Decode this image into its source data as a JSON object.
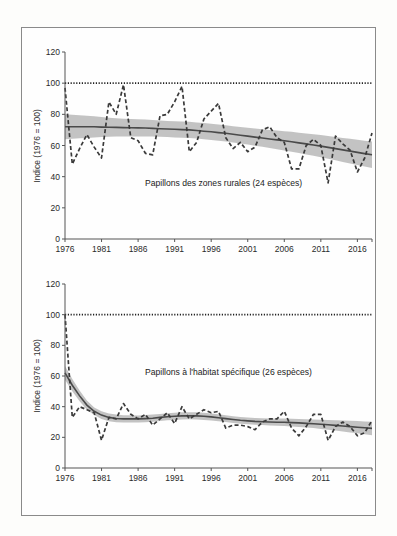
{
  "chart_data": [
    {
      "type": "line",
      "title": "Papillons des zones rurales (24 espèces)",
      "xlabel": "",
      "ylabel": "Indice (1976 = 100)",
      "ylim": [
        0,
        120
      ],
      "yticks": [
        0,
        20,
        40,
        60,
        80,
        100,
        120
      ],
      "xticks": [
        1976,
        1981,
        1986,
        1991,
        1996,
        2001,
        2006,
        2011,
        2016
      ],
      "xlim": [
        1976,
        2018
      ],
      "reference_line": {
        "value": 100,
        "style": "dotted"
      },
      "grid": false,
      "x": [
        1976,
        1977,
        1978,
        1979,
        1980,
        1981,
        1982,
        1983,
        1984,
        1985,
        1986,
        1987,
        1988,
        1989,
        1990,
        1991,
        1992,
        1993,
        1994,
        1995,
        1996,
        1997,
        1998,
        1999,
        2000,
        2001,
        2002,
        2003,
        2004,
        2005,
        2006,
        2007,
        2008,
        2009,
        2010,
        2011,
        2012,
        2013,
        2014,
        2015,
        2016,
        2017,
        2018
      ],
      "series": [
        {
          "name": "Indice annuel",
          "style": "dashed",
          "values": [
            97,
            48,
            58,
            67,
            59,
            52,
            88,
            80,
            99,
            65,
            63,
            55,
            54,
            79,
            80,
            88,
            98,
            56,
            62,
            77,
            82,
            87,
            65,
            58,
            62,
            56,
            59,
            70,
            72,
            65,
            62,
            45,
            45,
            60,
            64,
            60,
            36,
            66,
            61,
            57,
            43,
            52,
            68
          ]
        },
        {
          "name": "Tendance lissée",
          "style": "solid",
          "values": [
            72,
            72,
            72,
            72,
            72,
            71.8,
            71.7,
            71.6,
            71.5,
            71.4,
            71.3,
            71.2,
            71,
            70.8,
            70.6,
            70.4,
            70.2,
            70,
            69.6,
            69.2,
            68.8,
            68.3,
            67.8,
            67.2,
            66.6,
            66,
            65.4,
            64.8,
            64.2,
            63.6,
            63,
            62.4,
            61.7,
            61,
            60.3,
            59.6,
            58.8,
            58,
            57.2,
            56.4,
            55.6,
            54.8,
            54
          ]
        },
        {
          "name": "Intervalle de confiance (bas)",
          "style": "band",
          "values": [
            64,
            64.3,
            64.6,
            64.9,
            65.2,
            65.4,
            65.6,
            65.7,
            65.8,
            65.8,
            65.8,
            65.8,
            65.7,
            65.6,
            65.4,
            65.2,
            65,
            64.8,
            64.4,
            64,
            63.6,
            63.1,
            62.6,
            62,
            61.3,
            60.6,
            59.9,
            59.2,
            58.4,
            57.6,
            56.8,
            56,
            55.2,
            54.3,
            53.4,
            52.5,
            51.5,
            50.5,
            49.5,
            48.5,
            47.5,
            46.5,
            45.5
          ]
        },
        {
          "name": "Intervalle de confiance (haut)",
          "style": "band",
          "values": [
            80,
            79.7,
            79.4,
            79.1,
            78.8,
            78.2,
            77.8,
            77.5,
            77.2,
            77,
            76.8,
            76.6,
            76.3,
            76,
            75.8,
            75.6,
            75.4,
            75.2,
            74.8,
            74.4,
            74,
            73.5,
            73,
            72.4,
            71.9,
            71.4,
            70.9,
            70.4,
            70,
            69.6,
            69.2,
            68.8,
            68.2,
            67.7,
            67.2,
            66.7,
            66.1,
            65.5,
            64.9,
            64.3,
            63.7,
            63.1,
            62.5
          ]
        }
      ]
    },
    {
      "type": "line",
      "title": "Papillons à l'habitat spécifique (26 espèces)",
      "xlabel": "",
      "ylabel": "Indice (1976 = 100)",
      "ylim": [
        0,
        120
      ],
      "yticks": [
        0,
        20,
        40,
        60,
        80,
        100,
        120
      ],
      "xticks": [
        1976,
        1981,
        1986,
        1991,
        1996,
        2001,
        2006,
        2011,
        2016
      ],
      "xlim": [
        1976,
        2018
      ],
      "reference_line": {
        "value": 100,
        "style": "dotted"
      },
      "grid": false,
      "x": [
        1976,
        1977,
        1978,
        1979,
        1980,
        1981,
        1982,
        1983,
        1984,
        1985,
        1986,
        1987,
        1988,
        1989,
        1990,
        1991,
        1992,
        1993,
        1994,
        1995,
        1996,
        1997,
        1998,
        1999,
        2000,
        2001,
        2002,
        2003,
        2004,
        2005,
        2006,
        2007,
        2008,
        2009,
        2010,
        2011,
        2012,
        2013,
        2014,
        2015,
        2016,
        2017,
        2018
      ],
      "series": [
        {
          "name": "Indice annuel",
          "style": "dashed",
          "values": [
            100,
            33,
            40,
            38,
            36,
            18,
            33,
            32,
            42,
            35,
            32,
            35,
            28,
            32,
            36,
            29,
            40,
            32,
            35,
            38,
            36,
            37,
            26,
            28,
            28,
            27,
            25,
            30,
            32,
            32,
            37,
            26,
            21,
            27,
            35,
            35,
            18,
            27,
            30,
            27,
            21,
            23,
            31
          ]
        },
        {
          "name": "Tendance lissée",
          "style": "solid",
          "values": [
            62,
            54,
            47,
            41,
            37,
            34.5,
            33,
            32.3,
            32,
            32,
            32,
            32.2,
            32.5,
            33,
            33.4,
            33.7,
            34,
            34.1,
            34,
            33.7,
            33.3,
            32.8,
            32.2,
            31.6,
            31.1,
            30.7,
            30.4,
            30.2,
            30,
            29.9,
            29.8,
            29.6,
            29.4,
            29.1,
            28.8,
            28.5,
            28.2,
            27.8,
            27.4,
            27,
            26.6,
            26.2,
            25.8
          ]
        },
        {
          "name": "Intervalle de confiance (bas)",
          "style": "band",
          "values": [
            57.5,
            50,
            43.5,
            38,
            34.5,
            32,
            30.5,
            29.8,
            29.6,
            29.6,
            29.7,
            29.9,
            30.2,
            30.7,
            31.1,
            31.4,
            31.7,
            31.8,
            31.7,
            31.4,
            31,
            30.5,
            30,
            29.4,
            28.9,
            28.5,
            28.2,
            28,
            27.8,
            27.6,
            27.4,
            27.1,
            26.8,
            26.4,
            26,
            25.5,
            25,
            24.4,
            23.8,
            23.2,
            22.6,
            22,
            21.4
          ]
        },
        {
          "name": "Intervalle de confiance (haut)",
          "style": "band",
          "values": [
            66.5,
            58,
            50.5,
            44,
            39.5,
            37,
            35.5,
            34.8,
            34.4,
            34.4,
            34.3,
            34.5,
            34.8,
            35.3,
            35.7,
            36,
            36.3,
            36.4,
            36.3,
            36,
            35.6,
            35.1,
            34.4,
            33.8,
            33.3,
            32.9,
            32.6,
            32.4,
            32.2,
            32.2,
            32.2,
            32.1,
            32,
            31.8,
            31.6,
            31.5,
            31.4,
            31.2,
            31,
            30.8,
            30.6,
            30.4,
            30.2
          ]
        }
      ]
    }
  ],
  "panels": [
    {
      "ylabel": "Indice (1976 = 100)",
      "series_label": "Papillons des zones rurales (24 espèces)"
    },
    {
      "ylabel": "Indice (1976 = 100)",
      "series_label": "Papillons à l'habitat spécifique (26 espèces)"
    }
  ],
  "colors": {
    "dashed_line": "#3a3a3a",
    "trend_line": "#4a4a4a",
    "band": "#bdbdbd",
    "reference_line": "#222222",
    "axis": "#555555",
    "frame": "#8a8a8a"
  }
}
